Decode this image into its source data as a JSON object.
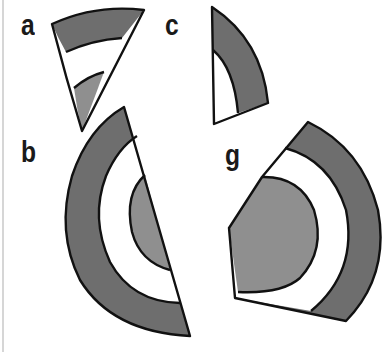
{
  "figure": {
    "labels": [
      {
        "id": "a",
        "text": "a"
      },
      {
        "id": "c",
        "text": "c"
      },
      {
        "id": "b",
        "text": "b"
      },
      {
        "id": "g",
        "text": "g"
      }
    ],
    "colors": {
      "outer_band": "#6e6e6e",
      "inner_core": "#8f8f8f",
      "gap_band": "#ffffff",
      "outline": "#111111",
      "background": "#ffffff"
    },
    "pieces": [
      {
        "label": "a",
        "description": "narrow wedge: dark outer band, white band, gray inner band"
      },
      {
        "label": "c",
        "description": "narrow wedge: dark outer band, white inner region"
      },
      {
        "label": "b",
        "description": "half-disc slice: dark outer band, white band, gray inner semicircle"
      },
      {
        "label": "g",
        "description": "large sector: dark outer band, white band, gray inner circle"
      }
    ]
  }
}
